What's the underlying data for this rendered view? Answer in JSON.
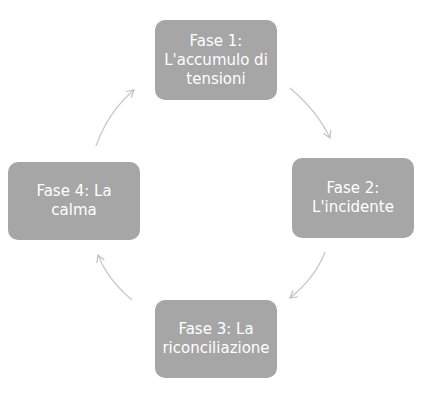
{
  "diagram": {
    "type": "cycle",
    "phases": [
      {
        "id": 1,
        "label": "Fase 1: L'accumulo di tensioni"
      },
      {
        "id": 2,
        "label": "Fase 2: L'incidente"
      },
      {
        "id": 3,
        "label": "Fase 3: La riconciliazione"
      },
      {
        "id": 4,
        "label": "Fase 4: La calma"
      }
    ],
    "arrows": [
      {
        "from": 1,
        "to": 2
      },
      {
        "from": 2,
        "to": 3
      },
      {
        "from": 3,
        "to": 4
      },
      {
        "from": 4,
        "to": 1
      }
    ],
    "colors": {
      "box_fill": "#a6a6a6",
      "box_text": "#ffffff",
      "arrow": "#c8c8c8"
    }
  }
}
